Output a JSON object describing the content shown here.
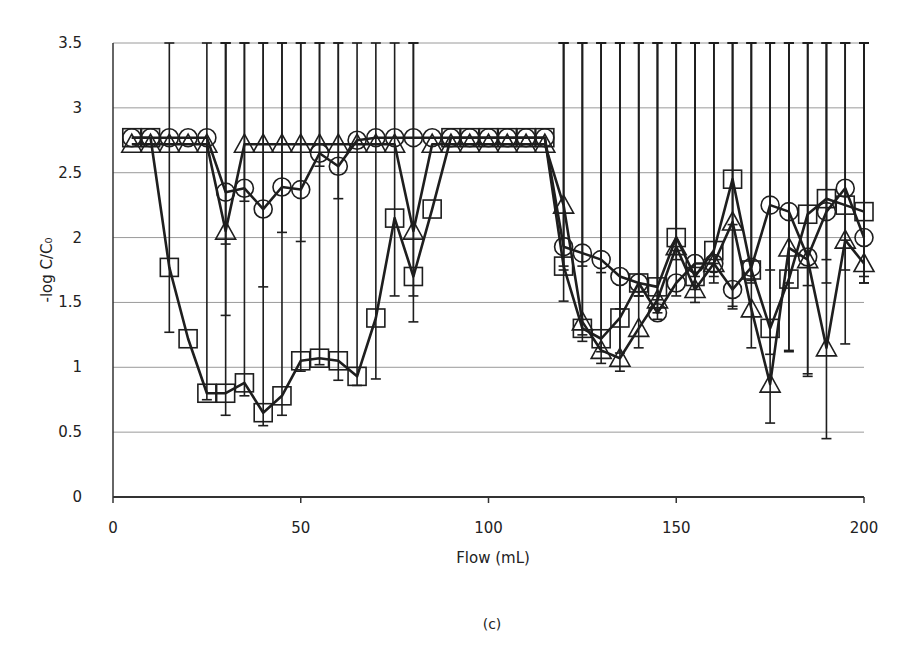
{
  "caption": "(c)",
  "chart_data": {
    "type": "line",
    "title": "",
    "xlabel": "Flow (mL)",
    "ylabel": "-log C/C₀",
    "xlim": [
      0,
      200
    ],
    "ylim": [
      0,
      3.5
    ],
    "xticks": [
      0,
      50,
      100,
      150,
      200
    ],
    "yticks": [
      0,
      0.5,
      1,
      1.5,
      2,
      2.5,
      3,
      3.5
    ],
    "ytick_labels": [
      "0",
      "0.5",
      "1",
      "1.5",
      "2",
      "2.5",
      "3",
      "3.5"
    ],
    "grid": "horizontal",
    "legend": "none",
    "x": [
      5,
      10,
      15,
      20,
      25,
      30,
      35,
      40,
      45,
      50,
      55,
      60,
      65,
      70,
      75,
      80,
      85,
      90,
      95,
      100,
      105,
      110,
      115,
      120,
      125,
      130,
      135,
      140,
      145,
      150,
      155,
      160,
      165,
      170,
      175,
      180,
      185,
      190,
      195,
      200
    ],
    "series": [
      {
        "name": "square",
        "marker": "square",
        "values": [
          2.77,
          2.77,
          1.77,
          1.22,
          0.8,
          0.8,
          0.88,
          0.65,
          0.78,
          1.05,
          1.07,
          1.05,
          0.93,
          1.38,
          2.15,
          1.7,
          2.22,
          2.77,
          2.77,
          2.77,
          2.77,
          2.77,
          2.77,
          1.78,
          1.3,
          1.22,
          1.38,
          1.65,
          1.62,
          2.0,
          1.7,
          1.9,
          2.45,
          1.75,
          1.3,
          1.68,
          2.18,
          2.3,
          2.25,
          2.2
        ],
        "errors": [
          0,
          0,
          0.5,
          0,
          0.05,
          0.17,
          0.1,
          0.1,
          0.15,
          0.08,
          0.05,
          0.15,
          0.07,
          0.47,
          0.6,
          0.35,
          0,
          0,
          0,
          0,
          0,
          0,
          0,
          0.27,
          0.1,
          0.1,
          0.27,
          0.1,
          0.1,
          0.1,
          0.1,
          0.1,
          0.35,
          0.1,
          0.2,
          0.55,
          0.55,
          0.47,
          0.5,
          0.55
        ]
      },
      {
        "name": "circle",
        "marker": "circle",
        "values": [
          2.77,
          2.77,
          2.77,
          2.77,
          2.77,
          2.35,
          2.38,
          2.22,
          2.39,
          2.37,
          2.65,
          2.55,
          2.75,
          2.77,
          2.77,
          2.77,
          2.77,
          2.77,
          2.77,
          2.77,
          2.77,
          2.77,
          2.77,
          1.93,
          1.88,
          1.83,
          1.7,
          1.65,
          1.42,
          1.65,
          1.8,
          1.8,
          1.6,
          1.77,
          2.25,
          2.2,
          1.85,
          2.2,
          2.38,
          2.0
        ],
        "errors": [
          0,
          0,
          0,
          0,
          0,
          0.4,
          0.1,
          0.6,
          0.35,
          0.4,
          0.1,
          0.25,
          0,
          0,
          0,
          0,
          0,
          0,
          0,
          0,
          0,
          0,
          0,
          0.15,
          0.1,
          0.1,
          0.25,
          0.1,
          0.05,
          0.1,
          0.1,
          0.1,
          0.15,
          0.1,
          0.5,
          0.55,
          0.9,
          0.55,
          0.4,
          0.3
        ]
      },
      {
        "name": "triangle",
        "marker": "triangle",
        "values": [
          2.72,
          2.72,
          2.72,
          2.72,
          2.72,
          2.05,
          2.72,
          2.72,
          2.72,
          2.72,
          2.72,
          2.72,
          2.72,
          2.72,
          2.72,
          2.05,
          2.72,
          2.72,
          2.72,
          2.72,
          2.72,
          2.72,
          2.72,
          2.25,
          1.35,
          1.13,
          1.07,
          1.3,
          1.52,
          1.93,
          1.6,
          1.8,
          2.12,
          1.45,
          0.87,
          1.92,
          1.83,
          1.15,
          1.98,
          1.8
        ],
        "errors": [
          0,
          0,
          0,
          0,
          0,
          0.65,
          0,
          0,
          0,
          0,
          0,
          0,
          0,
          0,
          0,
          0.5,
          0,
          0,
          0,
          0,
          0,
          0,
          0,
          0.5,
          0.1,
          0.1,
          0.1,
          0.15,
          0.1,
          0.1,
          0.1,
          0.15,
          0.65,
          0.3,
          0.3,
          0.8,
          0.9,
          0.7,
          0.8,
          0.15
        ]
      }
    ]
  }
}
